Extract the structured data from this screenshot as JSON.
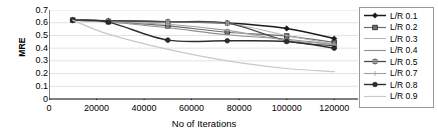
{
  "chart_data": {
    "type": "line",
    "title": "",
    "xlabel": "No of  Iterations",
    "ylabel": "MRE",
    "x": [
      10000,
      25000,
      50000,
      75000,
      100000,
      120000
    ],
    "xlim": [
      0,
      130000
    ],
    "ylim": [
      0,
      0.7
    ],
    "xticks": [
      0,
      20000,
      40000,
      60000,
      80000,
      100000,
      120000
    ],
    "xtick_labels": [
      "0",
      "20000",
      "40000",
      "60000",
      "80000",
      "100000",
      "120000"
    ],
    "yticks": [
      0,
      0.1,
      0.2,
      0.3,
      0.4,
      0.5,
      0.6,
      0.7
    ],
    "ytick_labels": [
      "0",
      "0.1",
      "0.2",
      "0.3",
      "0.4",
      "0.5",
      "0.6",
      "0.7"
    ],
    "grid": true,
    "legend_position": "right",
    "series": [
      {
        "name": "L/R 0.1",
        "values": [
          0.62,
          0.615,
          0.608,
          0.598,
          0.555,
          0.475
        ],
        "color": "#1a1a1a",
        "marker": "diamond",
        "width": 1.5
      },
      {
        "name": "L/R 0.2",
        "values": [
          0.62,
          0.608,
          0.575,
          0.525,
          0.495,
          0.445
        ],
        "color": "#6e6e6e",
        "marker": "square",
        "width": 1.2
      },
      {
        "name": "L/R 0.3",
        "values": [
          0.62,
          0.612,
          0.605,
          0.596,
          0.5,
          0.432
        ],
        "color": "#b5b5b5",
        "marker": "none",
        "width": 1.1
      },
      {
        "name": "L/R 0.4",
        "values": [
          0.62,
          0.606,
          0.56,
          0.505,
          0.47,
          0.428
        ],
        "color": "#8f8f8f",
        "marker": "none",
        "width": 1.1
      },
      {
        "name": "L/R 0.5",
        "values": [
          0.62,
          0.614,
          0.607,
          0.597,
          0.458,
          0.418
        ],
        "color": "#4a4a4a",
        "marker": "star",
        "width": 1.3
      },
      {
        "name": "L/R 0.7",
        "values": [
          0.62,
          0.605,
          0.588,
          0.54,
          0.462,
          0.43
        ],
        "color": "#a0a0a0",
        "marker": "plus",
        "width": 1.1
      },
      {
        "name": "L/R 0.8",
        "values": [
          0.62,
          0.605,
          0.463,
          0.458,
          0.452,
          0.4
        ],
        "color": "#2e2e2e",
        "marker": "circle",
        "width": 1.4
      },
      {
        "name": "L/R 0.9",
        "values": [
          0.62,
          0.51,
          0.39,
          0.3,
          0.24,
          0.215
        ],
        "color": "#c8c8c8",
        "marker": "none",
        "width": 1.2
      }
    ]
  },
  "axis": {
    "y_title": "MRE",
    "x_title": "No of  Iterations"
  },
  "colors": {
    "axis": "#000000",
    "grid": "#e2e2e2",
    "legend_border": "#9a9a9a",
    "background": "#ffffff"
  }
}
